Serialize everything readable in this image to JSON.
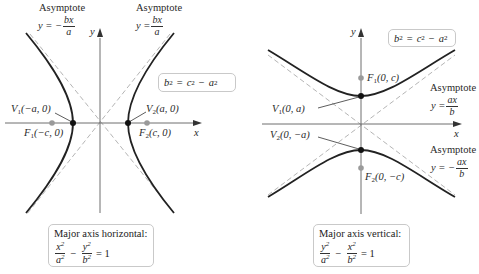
{
  "left_graph": {
    "asymptote_left": {
      "label": "Asymptote",
      "eq_prefix": "y = −",
      "num": "bx",
      "den": "a"
    },
    "asymptote_right": {
      "label": "Asymptote",
      "eq_prefix": "y =",
      "num": "bx",
      "den": "a"
    },
    "axis_x": "x",
    "axis_y": "y",
    "relation": {
      "lhs": "b",
      "rhs1": "c",
      "rhs2": "a"
    },
    "V1": {
      "name": "V",
      "sub": "1",
      "coord": "(−a, 0)"
    },
    "V2": {
      "name": "V",
      "sub": "2",
      "coord": "(a, 0)"
    },
    "F1": {
      "name": "F",
      "sub": "1",
      "coord": "(−c, 0)"
    },
    "F2": {
      "name": "F",
      "sub": "2",
      "coord": "(c, 0)"
    },
    "caption": {
      "title": "Major axis horizontal:",
      "term1": {
        "num": "x",
        "den": "a"
      },
      "term2": {
        "num": "y",
        "den": "b"
      },
      "equals": "= 1"
    }
  },
  "right_graph": {
    "asymptote_upper": {
      "label": "Asymptote",
      "eq_prefix": "y =",
      "num": "ax",
      "den": "b"
    },
    "asymptote_lower": {
      "label": "Asymptote",
      "eq_prefix": "y = −",
      "num": "ax",
      "den": "b"
    },
    "axis_x": "x",
    "axis_y": "y",
    "relation": {
      "lhs": "b",
      "rhs1": "c",
      "rhs2": "a"
    },
    "V1": {
      "name": "V",
      "sub": "1",
      "coord": "(0, a)"
    },
    "V2": {
      "name": "V",
      "sub": "2",
      "coord": "(0, −a)"
    },
    "F1": {
      "name": "F",
      "sub": "1",
      "coord": "(0, c)"
    },
    "F2": {
      "name": "F",
      "sub": "2",
      "coord": "(0, −c)"
    },
    "caption": {
      "title": "Major axis vertical:",
      "term1": {
        "num": "y",
        "den": "a"
      },
      "term2": {
        "num": "x",
        "den": "b"
      },
      "equals": "= 1"
    }
  },
  "colors": {
    "curve": "#222222",
    "axis": "#6e6e6e",
    "asymptote": "#b5b5b5",
    "focus": "#9a9a9a",
    "vertex": "#111111",
    "box_border": "#c9c9c9"
  }
}
